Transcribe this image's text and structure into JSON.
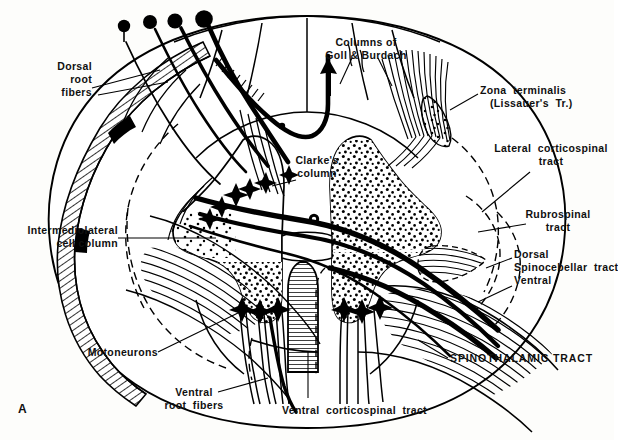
{
  "figure": {
    "panel_label": "A",
    "line_color": "#000000",
    "background_color": "#fdfdfb"
  },
  "labels": {
    "dorsal_root_fibers": "Dorsal\nroot\nfibers",
    "columns_goll_burdach": "Columns of\nGoll & Burdach",
    "zona_terminalis": "Zona  terminalis",
    "zona_terminalis_sub": "(Lissauer's  Tr.)",
    "lateral_corticospinal": "Lateral  corticospinal\ntract",
    "rubrospinal": "Rubrospinal\ntract",
    "dorsal_spinocerebellar": "Dorsal\nSpinocebellar  tract\nVentral",
    "clarkes_column": "Clarke's\ncolumn",
    "intermediolateral": "Intermediolateral\ncell column",
    "motoneurons": "Motoneurons",
    "ventral_root_fibers": "Ventral\nroot  fibers",
    "ventral_corticospinal": "Ventral  corticospinal  tract",
    "spinothalamic": "SPINOTHALAMIC TRACT"
  },
  "structures": {
    "dorsal_root_ganglion_cells": 4,
    "central_canal": "central-canal",
    "ventral_median_fissure": "ventral-median-fissure",
    "gray_matter": "butterfly-shaped-gray-matter",
    "white_matter_rim": "hatched-pial-rim",
    "ascending_arrow": "dorsal-column-ascending-arrow"
  }
}
